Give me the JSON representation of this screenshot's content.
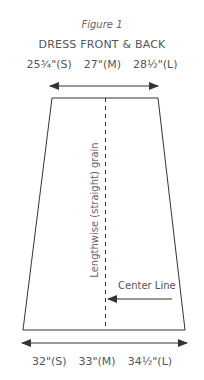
{
  "figure": {
    "label": "Figure 1",
    "title": "DRESS FRONT & BACK",
    "top_measurements": [
      {
        "value": "25¾\"",
        "size": "(S)",
        "text": "25¾\"(S)"
      },
      {
        "value": "27\"",
        "size": "(M)",
        "text": "27\"(M)"
      },
      {
        "value": "28½\"",
        "size": "(L)",
        "text": "28½\"(L)"
      }
    ],
    "bottom_measurements": [
      {
        "value": "32\"",
        "size": "(S)",
        "text": "32\"(S)"
      },
      {
        "value": "33\"",
        "size": "(M)",
        "text": "33\"(M)"
      },
      {
        "value": "34½\"",
        "size": "(L)",
        "text": "34½\"(L)"
      }
    ],
    "grain_label": "Lengthwise (straight) grain",
    "center_line_label": "Center Line",
    "colors": {
      "line": "#333333",
      "text": "#555555"
    }
  }
}
